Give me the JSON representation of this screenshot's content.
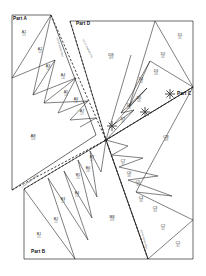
{
  "diagram": {
    "background_color": "#ffffff",
    "line_color": "#2b2b2b",
    "dashed_color": "#1c1c1c",
    "label_color": "#2a2a2a",
    "sub_label_color": "#6b6b6b"
  },
  "part_labels": [
    {
      "name": "part-a",
      "text": "Part A",
      "x": 13,
      "y": 17
    },
    {
      "name": "part-d",
      "text": "Part D",
      "x": 76,
      "y": 22
    },
    {
      "name": "part-c",
      "text": "Part C",
      "x": 177,
      "y": 95
    },
    {
      "name": "part-b",
      "text": "Part B",
      "x": 31,
      "y": 253
    }
  ],
  "pieces": [
    {
      "id": "A1",
      "sub": "1/1",
      "x": 24,
      "y": 34,
      "rot": 0,
      "size": "normal"
    },
    {
      "id": "A2",
      "sub": "1/2",
      "x": 40,
      "y": 51,
      "rot": 0,
      "size": "normal"
    },
    {
      "id": "A3",
      "sub": "1/3",
      "x": 48,
      "y": 68,
      "rot": 0,
      "size": "normal"
    },
    {
      "id": "A4",
      "sub": "1/4",
      "x": 63,
      "y": 77,
      "rot": 0,
      "size": "normal"
    },
    {
      "id": "A5",
      "sub": "1/5",
      "x": 66,
      "y": 94,
      "rot": 0,
      "size": "normal"
    },
    {
      "id": "A6",
      "sub": "1/6",
      "x": 76,
      "y": 101,
      "rot": 0,
      "size": "normal"
    },
    {
      "id": "A7",
      "sub": "1/7",
      "x": 82,
      "y": 113,
      "rot": 0,
      "size": "normal"
    },
    {
      "id": "A8",
      "sub": "1/8",
      "x": 33,
      "y": 138,
      "rot": 0,
      "size": "big"
    },
    {
      "id": "B1",
      "sub": "2/1",
      "x": 39,
      "y": 236,
      "rot": 0,
      "size": "normal"
    },
    {
      "id": "B2",
      "sub": "2/2",
      "x": 56,
      "y": 221,
      "rot": 0,
      "size": "normal"
    },
    {
      "id": "B3",
      "sub": "2/3",
      "x": 63,
      "y": 201,
      "rot": 0,
      "size": "normal"
    },
    {
      "id": "B4",
      "sub": "2/4",
      "x": 77,
      "y": 195,
      "rot": 0,
      "size": "normal"
    },
    {
      "id": "B5",
      "sub": "2/5",
      "x": 78,
      "y": 177,
      "rot": 0,
      "size": "normal"
    },
    {
      "id": "B6",
      "sub": "2/6",
      "x": 88,
      "y": 170,
      "rot": 0,
      "size": "normal"
    },
    {
      "id": "B7",
      "sub": "2/7",
      "x": 92,
      "y": 159,
      "rot": 0,
      "size": "normal"
    },
    {
      "id": "B8",
      "sub": "2/8",
      "x": 112,
      "y": 219,
      "rot": 0,
      "size": "big"
    },
    {
      "id": "C1",
      "sub": "3/1",
      "x": 178,
      "y": 245,
      "rot": 0,
      "size": "normal"
    },
    {
      "id": "C2",
      "sub": "3/2",
      "x": 163,
      "y": 228,
      "rot": 0,
      "size": "normal"
    },
    {
      "id": "C3",
      "sub": "3/3",
      "x": 155,
      "y": 210,
      "rot": 0,
      "size": "normal"
    },
    {
      "id": "C4",
      "sub": "3/4",
      "x": 141,
      "y": 200,
      "rot": 0,
      "size": "normal"
    },
    {
      "id": "C5",
      "sub": "3/5",
      "x": 138,
      "y": 184,
      "rot": 0,
      "size": "normal"
    },
    {
      "id": "C6",
      "sub": "3/6",
      "x": 129,
      "y": 175,
      "rot": 0,
      "size": "normal"
    },
    {
      "id": "C7",
      "sub": "3/7",
      "x": 123,
      "y": 163,
      "rot": 0,
      "size": "normal"
    },
    {
      "id": "C8",
      "sub": "3/8",
      "x": 166,
      "y": 139,
      "rot": 0,
      "size": "big"
    },
    {
      "id": "D1",
      "sub": "4/1",
      "x": 180,
      "y": 37,
      "rot": 0,
      "size": "normal"
    },
    {
      "id": "D2",
      "sub": "4/2",
      "x": 163,
      "y": 56,
      "rot": 0,
      "size": "normal"
    },
    {
      "id": "D3",
      "sub": "4/3",
      "x": 156,
      "y": 73,
      "rot": 0,
      "size": "normal"
    },
    {
      "id": "D4",
      "sub": "4/4",
      "x": 141,
      "y": 81,
      "rot": 0,
      "size": "normal"
    },
    {
      "id": "D5",
      "sub": "4/5",
      "x": 139,
      "y": 100,
      "rot": 0,
      "size": "normal"
    },
    {
      "id": "D6",
      "sub": "4/6",
      "x": 129,
      "y": 107,
      "rot": 0,
      "size": "normal"
    },
    {
      "id": "D7",
      "sub": "4/7",
      "x": 123,
      "y": 121,
      "rot": 0,
      "size": "normal"
    },
    {
      "id": "D8",
      "sub": "4/8",
      "x": 111,
      "y": 57,
      "rot": 0,
      "size": "big"
    }
  ],
  "seam_notes": [
    {
      "name": "seam-note-a",
      "text": "cut on dashed line",
      "x": 57,
      "y": 36,
      "rot": 74
    },
    {
      "name": "seam-note-d",
      "text": "cut on dashed line",
      "x": 83,
      "y": 38,
      "rot": 64
    },
    {
      "name": "seam-note-b",
      "text": "cut on dashed line",
      "x": 22,
      "y": 186,
      "rot": -38
    },
    {
      "name": "seam-note-c",
      "text": "cut on dashed line",
      "x": 141,
      "y": 228,
      "rot": 74
    }
  ],
  "markers": [
    {
      "name": "center-point",
      "x": 106,
      "y": 140
    },
    {
      "name": "asterisk-1",
      "x": 112,
      "y": 126
    },
    {
      "name": "asterisk-2",
      "x": 145,
      "y": 112
    },
    {
      "name": "asterisk-3",
      "x": 170,
      "y": 94
    }
  ]
}
